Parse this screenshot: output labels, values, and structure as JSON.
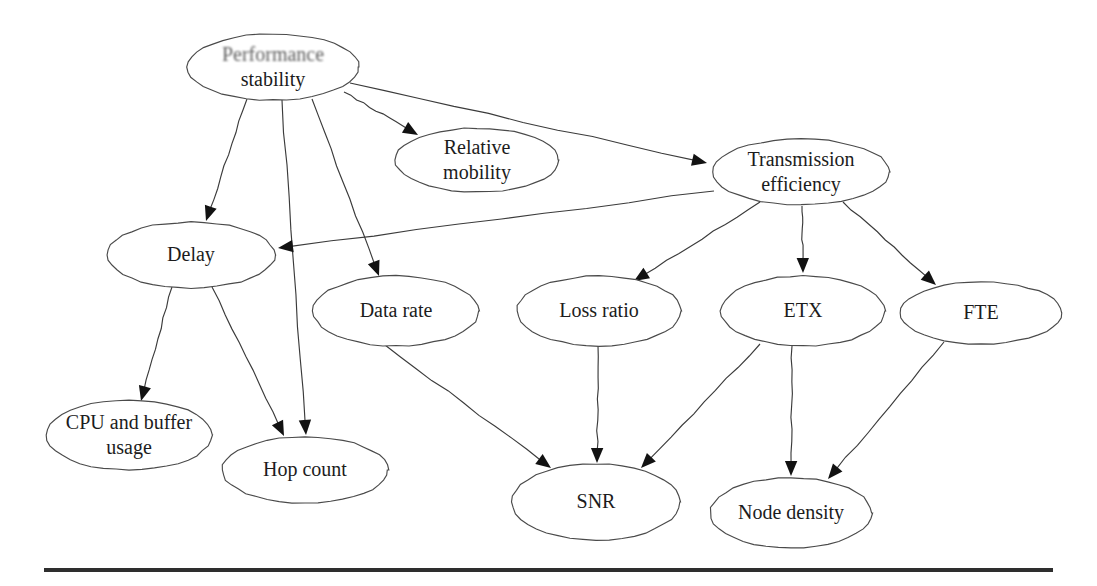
{
  "figure": {
    "type": "directed-graph",
    "background_color": "#ffffff",
    "node_stroke_color": "#4a4a4a",
    "edge_color": "#3b3b3b",
    "text_color": "#1c1c1c",
    "rule_color": "#2e2e2e"
  },
  "nodes": [
    {
      "id": "performance-stability",
      "label_line1": "Performance",
      "label_line2": "stability",
      "cx": 273,
      "cy": 67,
      "rx": 86,
      "ry": 33,
      "two_line": true,
      "blurred": true
    },
    {
      "id": "relative-mobility",
      "label_line1": "Relative",
      "label_line2": "mobility",
      "cx": 477,
      "cy": 160,
      "rx": 82,
      "ry": 32,
      "two_line": true,
      "blurred": false
    },
    {
      "id": "transmission-efficiency",
      "label_line1": "Transmission",
      "label_line2": "efficiency",
      "cx": 801,
      "cy": 172,
      "rx": 89,
      "ry": 33,
      "two_line": true,
      "blurred": false
    },
    {
      "id": "delay",
      "label_line1": "Delay",
      "label_line2": "",
      "cx": 191,
      "cy": 255,
      "rx": 84,
      "ry": 33,
      "two_line": false,
      "blurred": false
    },
    {
      "id": "data-rate",
      "label_line1": "Data rate",
      "label_line2": "",
      "cx": 396,
      "cy": 311,
      "rx": 83,
      "ry": 35,
      "two_line": false,
      "blurred": false
    },
    {
      "id": "loss-ratio",
      "label_line1": "Loss ratio",
      "label_line2": "",
      "cx": 599,
      "cy": 311,
      "rx": 82,
      "ry": 35,
      "two_line": false,
      "blurred": false
    },
    {
      "id": "etx",
      "label_line1": "ETX",
      "label_line2": "",
      "cx": 803,
      "cy": 311,
      "rx": 82,
      "ry": 35,
      "two_line": false,
      "blurred": false
    },
    {
      "id": "fte",
      "label_line1": "FTE",
      "label_line2": "",
      "cx": 981,
      "cy": 313,
      "rx": 81,
      "ry": 31,
      "two_line": false,
      "blurred": false
    },
    {
      "id": "cpu-and-buffer-usage",
      "label_line1": "CPU and buffer",
      "label_line2": "usage",
      "cx": 129,
      "cy": 435,
      "rx": 83,
      "ry": 35,
      "two_line": true,
      "blurred": false
    },
    {
      "id": "hop-count",
      "label_line1": "Hop count",
      "label_line2": "",
      "cx": 305,
      "cy": 470,
      "rx": 83,
      "ry": 33,
      "two_line": false,
      "blurred": false
    },
    {
      "id": "snr",
      "label_line1": "SNR",
      "label_line2": "",
      "cx": 596,
      "cy": 502,
      "rx": 84,
      "ry": 38,
      "two_line": false,
      "blurred": false
    },
    {
      "id": "node-density",
      "label_line1": "Node density",
      "label_line2": "",
      "cx": 791,
      "cy": 513,
      "rx": 81,
      "ry": 35,
      "two_line": false,
      "blurred": false
    }
  ],
  "edges": [
    {
      "id": "e1",
      "from": "performance-stability",
      "to": "relative-mobility",
      "x1": 344,
      "y1": 92,
      "x2": 418,
      "y2": 135
    },
    {
      "id": "e2",
      "from": "performance-stability",
      "to": "transmission-efficiency",
      "x1": 350,
      "y1": 83,
      "x2": 707,
      "y2": 163
    },
    {
      "id": "e3",
      "from": "performance-stability",
      "to": "delay",
      "x1": 247,
      "y1": 99,
      "x2": 206,
      "y2": 221
    },
    {
      "id": "e4",
      "from": "performance-stability",
      "to": "hop-count",
      "x1": 282,
      "y1": 100,
      "x2": 306,
      "y2": 435
    },
    {
      "id": "e5",
      "from": "performance-stability",
      "to": "data-rate",
      "x1": 312,
      "y1": 99,
      "x2": 379,
      "y2": 276
    },
    {
      "id": "e6",
      "from": "transmission-efficiency",
      "to": "delay",
      "x1": 714,
      "y1": 191,
      "x2": 278,
      "y2": 248
    },
    {
      "id": "e7",
      "from": "transmission-efficiency",
      "to": "loss-ratio",
      "x1": 760,
      "y1": 202,
      "x2": 634,
      "y2": 281
    },
    {
      "id": "e8",
      "from": "transmission-efficiency",
      "to": "etx",
      "x1": 802,
      "y1": 206,
      "x2": 803,
      "y2": 273
    },
    {
      "id": "e9",
      "from": "transmission-efficiency",
      "to": "fte",
      "x1": 843,
      "y1": 202,
      "x2": 936,
      "y2": 285
    },
    {
      "id": "e10",
      "from": "delay",
      "to": "cpu-and-buffer-usage",
      "x1": 172,
      "y1": 287,
      "x2": 141,
      "y2": 401
    },
    {
      "id": "e11",
      "from": "delay",
      "to": "hop-count",
      "x1": 212,
      "y1": 287,
      "x2": 284,
      "y2": 436
    },
    {
      "id": "e12",
      "from": "data-rate",
      "to": "snr",
      "x1": 385,
      "y1": 345,
      "x2": 551,
      "y2": 468
    },
    {
      "id": "e13",
      "from": "loss-ratio",
      "to": "snr",
      "x1": 598,
      "y1": 346,
      "x2": 597,
      "y2": 463
    },
    {
      "id": "e14",
      "from": "etx",
      "to": "snr",
      "x1": 760,
      "y1": 344,
      "x2": 641,
      "y2": 468
    },
    {
      "id": "e15",
      "from": "etx",
      "to": "node-density",
      "x1": 792,
      "y1": 346,
      "x2": 791,
      "y2": 476
    },
    {
      "id": "e16",
      "from": "fte",
      "to": "node-density",
      "x1": 944,
      "y1": 342,
      "x2": 828,
      "y2": 479
    }
  ],
  "rule": {
    "present": true,
    "label": "bottom-divider-rule"
  }
}
